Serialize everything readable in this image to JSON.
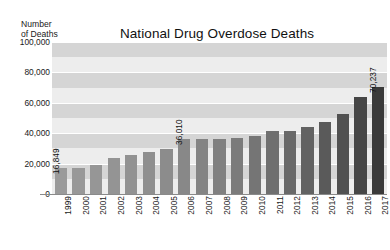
{
  "chart_data": {
    "type": "bar",
    "title": "National Drug Overdose Deaths",
    "ylabel": "Number\nof Deaths",
    "ylabel_line1": "Number",
    "ylabel_line2": "of Deaths",
    "xlabel": "",
    "ylim": [
      0,
      100000
    ],
    "ytick_labels": [
      "100,000",
      "80,000",
      "60,000",
      "40,000",
      "20,000",
      "0"
    ],
    "ytick_values": [
      100000,
      80000,
      60000,
      40000,
      20000,
      0
    ],
    "grid": true,
    "legend": "none",
    "categories": [
      "1999",
      "2000",
      "2001",
      "2002",
      "2003",
      "2004",
      "2005",
      "2006",
      "2007",
      "2008",
      "2009",
      "2010",
      "2011",
      "2012",
      "2013",
      "2014",
      "2015",
      "2016",
      "2017"
    ],
    "values": [
      16849,
      17415,
      19394,
      23518,
      25785,
      27424,
      29813,
      36010,
      36010,
      36450,
      37004,
      38329,
      41340,
      41502,
      43982,
      47055,
      52404,
      63632,
      70237
    ],
    "annotations": [
      {
        "category": "1999",
        "label": "16,849"
      },
      {
        "category": "2006",
        "label": "36,010"
      },
      {
        "category": "2017",
        "label": "70,237"
      }
    ],
    "bar_colors": [
      "#9a9a9a",
      "#989898",
      "#969696",
      "#949494",
      "#929292",
      "#8f8f8f",
      "#8c8c8c",
      "#888888",
      "#848484",
      "#808080",
      "#7b7b7b",
      "#757575",
      "#6f6f6f",
      "#696969",
      "#626262",
      "#5a5a5a",
      "#515151",
      "#464646",
      "#3a3a3a"
    ],
    "band_color_dark": "#d5d5d5",
    "band_color_light": "#ededed",
    "axis_color": "#8a8a8a",
    "background": "#ffffff"
  }
}
